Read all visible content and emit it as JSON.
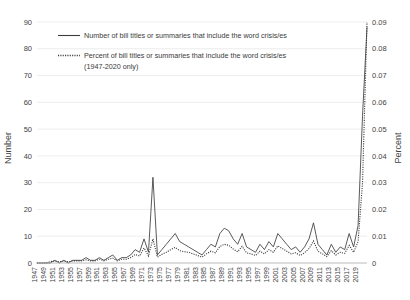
{
  "chart_data": {
    "type": "line",
    "title": "",
    "xlabel": "",
    "ylabel": "Number",
    "y2label": "Percent",
    "ylim": [
      0,
      90
    ],
    "y2lim": [
      0,
      0.09
    ],
    "yticks": [
      "0",
      "10",
      "20",
      "30",
      "40",
      "50",
      "60",
      "70",
      "80",
      "90"
    ],
    "y2ticks": [
      "0",
      "0.01",
      "0.02",
      "0.03",
      "0.04",
      "0.05",
      "0.06",
      "0.07",
      "0.08",
      "0.09"
    ],
    "grid": true,
    "legend_position": "upper-left",
    "x": [
      1947,
      1948,
      1949,
      1950,
      1951,
      1952,
      1953,
      1954,
      1955,
      1956,
      1957,
      1958,
      1959,
      1960,
      1961,
      1962,
      1963,
      1964,
      1965,
      1966,
      1967,
      1968,
      1969,
      1970,
      1971,
      1972,
      1973,
      1974,
      1975,
      1976,
      1977,
      1978,
      1979,
      1980,
      1981,
      1982,
      1983,
      1984,
      1985,
      1986,
      1987,
      1988,
      1989,
      1990,
      1991,
      1992,
      1993,
      1994,
      1995,
      1996,
      1997,
      1998,
      1999,
      2000,
      2001,
      2002,
      2003,
      2004,
      2005,
      2006,
      2007,
      2008,
      2009,
      2010,
      2011,
      2012,
      2013,
      2014,
      2015,
      2016,
      2017,
      2018,
      2019,
      2020,
      2021
    ],
    "xtick_labels": [
      "1947",
      "1949",
      "1951",
      "1953",
      "1955",
      "1957",
      "1959",
      "1961",
      "1963",
      "1965",
      "1967",
      "1969",
      "1971",
      "1973",
      "1975",
      "1977",
      "1979",
      "1981",
      "1983",
      "1985",
      "1987",
      "1989",
      "1991",
      "1993",
      "1995",
      "1997",
      "1999",
      "2001",
      "2003",
      "2005",
      "2007",
      "2009",
      "2011",
      "2013",
      "2015",
      "2017",
      "2019"
    ],
    "series": [
      {
        "name": "Number of bill titles or summaries that include the word crisis/es",
        "style": "solid",
        "axis": "left",
        "values": [
          0,
          0,
          0,
          0,
          1,
          0,
          1,
          0,
          1,
          1,
          1,
          2,
          1,
          1,
          2,
          1,
          2,
          3,
          1,
          2,
          2,
          3,
          5,
          4,
          9,
          4,
          32,
          3,
          5,
          7,
          9,
          11,
          8,
          7,
          6,
          5,
          4,
          3,
          5,
          7,
          6,
          11,
          13,
          12,
          9,
          7,
          11,
          6,
          5,
          4,
          7,
          5,
          8,
          6,
          11,
          9,
          7,
          5,
          6,
          4,
          6,
          9,
          15,
          7,
          5,
          3,
          7,
          4,
          6,
          5,
          11,
          6,
          14,
          55,
          88
        ]
      },
      {
        "name": "Percent of bill titles or summaries that include the word crisis/es (1947-2020 only)",
        "style": "dotted",
        "axis": "right",
        "values": [
          0,
          0,
          0,
          0.0005,
          0.0008,
          0.0004,
          0.0008,
          0.0004,
          0.0008,
          0.0008,
          0.0008,
          0.0012,
          0.0008,
          0.0008,
          0.0014,
          0.0008,
          0.0014,
          0.0018,
          0.0008,
          0.0014,
          0.0014,
          0.002,
          0.0032,
          0.0026,
          0.0056,
          0.0026,
          0.009,
          0.0022,
          0.0032,
          0.004,
          0.005,
          0.0058,
          0.0046,
          0.0042,
          0.004,
          0.0034,
          0.0028,
          0.0022,
          0.0034,
          0.0044,
          0.0038,
          0.0062,
          0.007,
          0.0066,
          0.0052,
          0.0042,
          0.0062,
          0.0038,
          0.0034,
          0.0028,
          0.0044,
          0.0034,
          0.005,
          0.004,
          0.0064,
          0.0054,
          0.0044,
          0.0034,
          0.0038,
          0.0028,
          0.0038,
          0.0054,
          0.0082,
          0.0044,
          0.0034,
          0.0024,
          0.0046,
          0.003,
          0.004,
          0.0036,
          0.0066,
          0.004,
          0.008,
          0.03,
          0.09
        ]
      }
    ]
  },
  "axes": {
    "left_title": "Number",
    "right_title": "Percent"
  },
  "legend": {
    "entries": [
      {
        "label": "Number of bill titles or summaries that include the word crisis/es",
        "style": "solid"
      },
      {
        "label": "Percent of bill titles or summaries that include the word crisis/es",
        "style": "dotted"
      },
      {
        "label": "(1947-2020 only)",
        "style": "none"
      }
    ]
  }
}
